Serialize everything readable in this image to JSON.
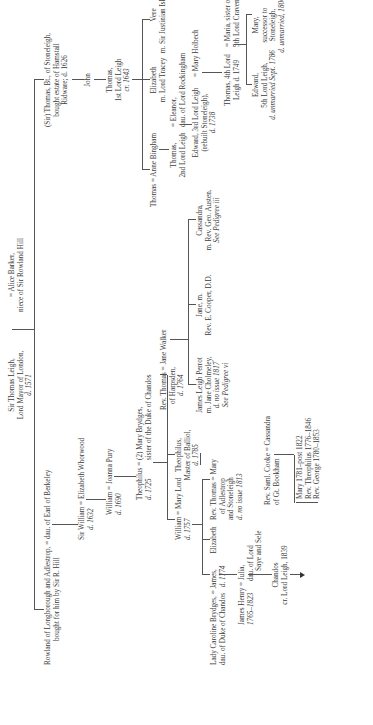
{
  "document": {
    "type": "genealogical-pedigree",
    "orientation": "rotated-90-ccw"
  },
  "nodes": {
    "sir_thomas_leigh": {
      "line1": "Sir Thomas Leigh,",
      "line2": "Lord Mayor of London,",
      "line3": "d. 1571"
    },
    "alice_barker": {
      "line1": "= Alice Barker,",
      "line2": "niece of Sir Rowland Hill"
    },
    "rowland": {
      "line1": "Rowland of Longborough and Adlestrop, = dau. of Earl of Berkeley",
      "line2": "bought for him by Sir R. Hill"
    },
    "sir_thomas_bt": {
      "line1": "(Sir) Thomas, Bt., of Stoneleigh,",
      "line2": "bought estate of Hamstall",
      "line3": "Ridware; d. 1626"
    },
    "sir_william": {
      "line1": "Sir William = Elizabeth Whorwood",
      "line2": "d. 1632"
    },
    "john": {
      "line1": "John"
    },
    "william_1690": {
      "line1": "William = Joanna Pury",
      "line2": "d. 1690"
    },
    "thomas_1st_lord": {
      "line1": "Thomas,",
      "line2": "1st Lord Leigh",
      "line3": "cr. 1643"
    },
    "theophilus_1725": {
      "line1": "Theophilus = (2) Mary Brydges,",
      "line2": "d. 1725",
      "line3": "sister of the Duke of Chandos"
    },
    "thomas_anne": {
      "line1": "Thomas = Anne Bingham"
    },
    "elizabeth_tracy": {
      "line1": "Elizabeth",
      "line2": "m. Lord Tracey"
    },
    "vere": {
      "line1": "Vere",
      "line2": "m. Sir Justinian Isham, Bt."
    },
    "thomas_2nd_lord": {
      "line1": "Thomas,",
      "line2": "2nd Lord Leigh"
    },
    "eleanor": {
      "line1": "= Eleanor,",
      "line2": "dau. of Lord Rockingham"
    },
    "edward_3rd_lord": {
      "line1": "Edward, 3rd Lord Leigh",
      "line2": "(rebuilt Stoneleigh),",
      "line3": "d. 1738"
    },
    "mary_holbech": {
      "line1": "= Mary Holbech"
    },
    "thomas_4th_lord": {
      "line1": "Thomas, 4th Lord",
      "line2": "Leigh d. 1749"
    },
    "maria_craven": {
      "line1": "= Maria, sister of",
      "line2": "5th Lord Craven"
    },
    "edward_5th_lord": {
      "line1": "Edward,",
      "line2": "5th Lord Leigh,",
      "line3": "d. unmarried Sept. 1786"
    },
    "mary_successor": {
      "line1": "Mary,",
      "line2": "successor to",
      "line3": "Stoneleigh,",
      "line4": "d. unmarried, 1806"
    },
    "william_mary_lord": {
      "line1": "William = Mary Lord",
      "line2": "d. 1757"
    },
    "theophilus_balliol": {
      "line1": "Theophilus,",
      "line2": "Master of Balliol,",
      "line3": "d. 1785"
    },
    "rev_thomas_jane": {
      "line1": "Rev. Thomas = Jane Walker",
      "line2": "of Harpsden,",
      "line3": "d. 1764"
    },
    "james_leigh_perrot": {
      "line1": "James Leigh Perrot",
      "line2": "m. Jane Cholmeley,",
      "line3": "d. no issue 1817",
      "line4": "See Pedigree vi"
    },
    "jane_cooper": {
      "line1": "Jane, m.",
      "line2": "Rev. E. Cooper, D.D."
    },
    "cassandra_austen": {
      "line1": "Cassandra,",
      "line2": "m. Rev. Geo. Austen.",
      "line3": "See Pedigree iii"
    },
    "lady_caroline": {
      "line1": "Lady Caroline Brydges, = James,",
      "line2": "dau. of Duke of Chandos",
      "line3": "d. 1774"
    },
    "elizabeth_b": {
      "line1": "Elizabeth"
    },
    "rev_thomas_adlestrop": {
      "line1": "Rev. Thomas = Mary",
      "line2": "of Adlestrop",
      "line3": "and Stoneleigh",
      "line4": "d. no issue 1813"
    },
    "james_henry": {
      "line1": "James Henry = Julia,",
      "line2": "1765–1823",
      "line3": "dau. of Lord",
      "line4": "Saye and Sele"
    },
    "rev_saml_cooke": {
      "line1": "Rev. Saml. Cooke = Cassandra",
      "line2": "of Gt. Bookham"
    },
    "chandos": {
      "line1": "Chandos",
      "line2": "cr. Lord Leigh, 1839"
    },
    "cooke_children": {
      "line1": "Mary 1781–post 1822",
      "line2": "Rev. Theophilus 1776–1846",
      "line3": "Rev. George 1780–1853"
    }
  }
}
